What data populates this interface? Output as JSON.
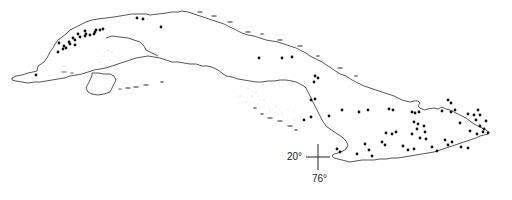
{
  "map": {
    "region": "Cuba",
    "graticule": {
      "latitude_label": "20°",
      "longitude_label": "76°",
      "cross_x": 318,
      "cross_y": 157
    },
    "colors": {
      "coastline": "#444444",
      "points": "#111111",
      "shoals": "#bbbbbb"
    },
    "points": [
      [
        59,
        43
      ],
      [
        64,
        46
      ],
      [
        69,
        42
      ],
      [
        75,
        40
      ],
      [
        80,
        37
      ],
      [
        85,
        36
      ],
      [
        90,
        35
      ],
      [
        95,
        32
      ],
      [
        100,
        30
      ],
      [
        103,
        29
      ],
      [
        73,
        38
      ],
      [
        78,
        34
      ],
      [
        85,
        31
      ],
      [
        86,
        34
      ],
      [
        94,
        34
      ],
      [
        96,
        30
      ],
      [
        58,
        52
      ],
      [
        63,
        49
      ],
      [
        66,
        48
      ],
      [
        70,
        44
      ],
      [
        75,
        45
      ],
      [
        137,
        18
      ],
      [
        143,
        19
      ],
      [
        161,
        27
      ],
      [
        36,
        75
      ],
      [
        259,
        58
      ],
      [
        282,
        58
      ],
      [
        292,
        57
      ],
      [
        315,
        76
      ],
      [
        318,
        78
      ],
      [
        314,
        82
      ],
      [
        311,
        100
      ],
      [
        315,
        99
      ],
      [
        304,
        120
      ],
      [
        311,
        117
      ],
      [
        329,
        116
      ],
      [
        342,
        110
      ],
      [
        359,
        112
      ],
      [
        368,
        110
      ],
      [
        389,
        109
      ],
      [
        393,
        110
      ],
      [
        412,
        112
      ],
      [
        415,
        113
      ],
      [
        419,
        112
      ],
      [
        414,
        122
      ],
      [
        418,
        124
      ],
      [
        424,
        126
      ],
      [
        417,
        129
      ],
      [
        425,
        132
      ],
      [
        448,
        100
      ],
      [
        451,
        103
      ],
      [
        442,
        111
      ],
      [
        451,
        112
      ],
      [
        455,
        110
      ],
      [
        468,
        114
      ],
      [
        474,
        115
      ],
      [
        478,
        110
      ],
      [
        480,
        115
      ],
      [
        486,
        121
      ],
      [
        484,
        129
      ],
      [
        460,
        123
      ],
      [
        470,
        131
      ],
      [
        477,
        134
      ],
      [
        483,
        132
      ],
      [
        488,
        133
      ],
      [
        480,
        126
      ],
      [
        476,
        120
      ],
      [
        386,
        133
      ],
      [
        392,
        134
      ],
      [
        396,
        132
      ],
      [
        412,
        134
      ],
      [
        420,
        138
      ],
      [
        426,
        139
      ],
      [
        445,
        140
      ],
      [
        452,
        142
      ],
      [
        448,
        145
      ],
      [
        403,
        146
      ],
      [
        408,
        150
      ],
      [
        414,
        149
      ],
      [
        382,
        142
      ],
      [
        385,
        145
      ],
      [
        365,
        144
      ],
      [
        369,
        150
      ],
      [
        337,
        149
      ],
      [
        340,
        152
      ],
      [
        357,
        154
      ],
      [
        372,
        156
      ],
      [
        461,
        147
      ],
      [
        468,
        148
      ],
      [
        432,
        147
      ],
      [
        437,
        151
      ],
      [
        218,
        208
      ]
    ]
  }
}
